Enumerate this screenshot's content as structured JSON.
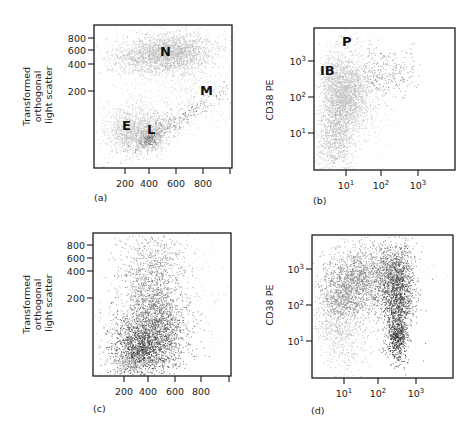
{
  "chart_data": [
    {
      "id": "a",
      "type": "scatter",
      "panel_label": "(a)",
      "xlabel": "",
      "ylabel": "Transformed orthogonal light scatter",
      "x_scale": "linear",
      "y_scale": "transformed",
      "x_ticks": [
        "200",
        "400",
        "600",
        "800",
        ""
      ],
      "y_ticks": [
        "800",
        "600",
        "400",
        "200"
      ],
      "xlim": [
        0,
        1000
      ],
      "region_labels": [
        {
          "text": "N",
          "x": 520,
          "y": 600
        },
        {
          "text": "M",
          "x": 660,
          "y": 200
        },
        {
          "text": "E",
          "x": 230,
          "y": 60
        },
        {
          "text": "L",
          "x": 420,
          "y": 55
        }
      ],
      "populations": [
        {
          "name": "N (neutrophils)",
          "shade": "light",
          "center": [
            520,
            600
          ],
          "approx_count": "dense"
        },
        {
          "name": "M (monocytes)",
          "shade": "light",
          "center": [
            650,
            220
          ],
          "approx_count": "sparse"
        },
        {
          "name": "E (eosinophils)",
          "shade": "light",
          "center": [
            240,
            50
          ],
          "approx_count": "medium"
        },
        {
          "name": "L (lymphocytes)",
          "shade": "light",
          "center": [
            400,
            40
          ],
          "approx_count": "medium"
        },
        {
          "name": "gated blasts",
          "shade": "dark",
          "center": [
            650,
            90
          ],
          "approx_count": "sparse"
        }
      ]
    },
    {
      "id": "b",
      "type": "scatter",
      "panel_label": "(b)",
      "xlabel": "",
      "ylabel": "CD38 PE",
      "x_scale": "log",
      "y_scale": "log",
      "x_ticks": [
        "10^1",
        "10^2",
        "10^3"
      ],
      "y_ticks": [
        "10^3",
        "10^2",
        "10^1"
      ],
      "region_labels": [
        {
          "text": "P",
          "x": 20,
          "y": 3000
        },
        {
          "text": "IB",
          "x": 1.5,
          "y": 700
        }
      ],
      "populations": [
        {
          "name": "IB cluster",
          "shade": "light",
          "center": [
            8,
            50
          ],
          "approx_count": "dense"
        },
        {
          "name": "gated blasts",
          "shade": "dark",
          "center": [
            100,
            250
          ],
          "approx_count": "sparse"
        }
      ]
    },
    {
      "id": "c",
      "type": "scatter",
      "panel_label": "(c)",
      "xlabel": "",
      "ylabel": "Transformed orthogonal light scatter",
      "x_scale": "linear",
      "y_scale": "transformed",
      "x_ticks": [
        "200",
        "400",
        "600",
        "800",
        ""
      ],
      "y_ticks": [
        "800",
        "600",
        "400",
        "200"
      ],
      "xlim": [
        0,
        1000
      ],
      "populations": [
        {
          "name": "main diagonal population",
          "shade": "dark",
          "center": [
            380,
            50
          ],
          "approx_count": "dense"
        },
        {
          "name": "upper spread",
          "shade": "medium",
          "center": [
            480,
            400
          ],
          "approx_count": "medium"
        },
        {
          "name": "low light cells",
          "shade": "light",
          "center": [
            250,
            30
          ],
          "approx_count": "sparse"
        }
      ]
    },
    {
      "id": "d",
      "type": "scatter",
      "panel_label": "(d)",
      "xlabel": "",
      "ylabel": "CD38 PE",
      "x_scale": "log",
      "y_scale": "log",
      "x_ticks": [
        "10^1",
        "10^2",
        "10^3"
      ],
      "y_ticks": [
        "10^3",
        "10^2",
        "10^1"
      ],
      "populations": [
        {
          "name": "left light population",
          "shade": "light",
          "center": [
            3,
            10
          ],
          "approx_count": "medium"
        },
        {
          "name": "middle population",
          "shade": "medium",
          "center": [
            20,
            150
          ],
          "approx_count": "dense"
        },
        {
          "name": "right dark population",
          "shade": "dark",
          "center": [
            180,
            60
          ],
          "approx_count": "dense"
        }
      ]
    }
  ]
}
